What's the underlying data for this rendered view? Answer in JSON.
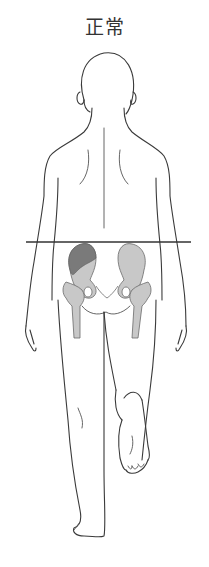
{
  "title": "正常",
  "figure": {
    "pelvis_line": {
      "y": 242,
      "x1": 26,
      "x2": 191,
      "color": "#333333"
    },
    "colors": {
      "outline": "#3a3a3a",
      "bone_fill": "#c8c8c8",
      "bone_stroke": "#6a6a6a",
      "highlighted_muscle": "#7a7a7a",
      "background": "#ffffff"
    },
    "highlighted_region": "left-gluteus-medius"
  }
}
